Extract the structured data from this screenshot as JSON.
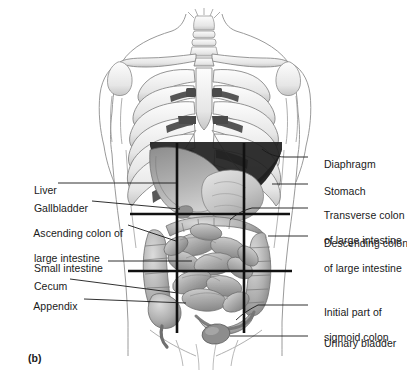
{
  "figure": {
    "caption": "(b)",
    "width": 407,
    "height": 387
  },
  "colors": {
    "line": "#1a1a1a",
    "outline": "#8a8a8a",
    "bone_light": "#f2f2f2",
    "bone_shade": "#c9c9c9",
    "organ_mid": "#a8a8a8",
    "organ_light": "#cfcfcf",
    "organ_dark": "#6e6e6e",
    "diaphragm_dark": "#2b2b2b",
    "background": "#ffffff"
  },
  "labels_left": [
    {
      "id": "liver",
      "text": "Liver",
      "x": 22,
      "y": 178,
      "lead_x1": 58,
      "lead_y1": 183,
      "lead_x2": 176,
      "lead_y2": 183
    },
    {
      "id": "gallbladder",
      "text": "Gallbladder",
      "x": 22,
      "y": 196,
      "lead_x1": 92,
      "lead_y1": 201,
      "lead_x2": 180,
      "lead_y2": 208
    },
    {
      "id": "ascending-colon",
      "text": "Ascending colon of",
      "text2": "large intestine",
      "x": 22,
      "y": 221,
      "lead_x1": 128,
      "lead_y1": 225,
      "lead_x2": 178,
      "lead_y2": 240
    },
    {
      "id": "small-intestine",
      "text": "Small intestine",
      "x": 22,
      "y": 256,
      "lead_x1": 108,
      "lead_y1": 261,
      "lead_x2": 190,
      "lead_y2": 261
    },
    {
      "id": "cecum",
      "text": "Cecum",
      "x": 22,
      "y": 274,
      "lead_x1": 70,
      "lead_y1": 279,
      "lead_x2": 180,
      "lead_y2": 292
    },
    {
      "id": "appendix",
      "text": "Appendix",
      "x": 22,
      "y": 294,
      "lead_x1": 84,
      "lead_y1": 299,
      "lead_x2": 186,
      "lead_y2": 303
    }
  ],
  "labels_right": [
    {
      "id": "diaphragm",
      "text": "Diaphragm",
      "x": 312,
      "y": 152,
      "lead_x1": 285,
      "lead_y1": 157,
      "lead_x2": 308,
      "lead_y2": 157
    },
    {
      "id": "stomach",
      "text": "Stomach",
      "x": 312,
      "y": 179,
      "lead_x1": 275,
      "lead_y1": 184,
      "lead_x2": 308,
      "lead_y2": 184
    },
    {
      "id": "transverse-colon",
      "text": "Transverse colon",
      "text2": "of large intestine",
      "x": 312,
      "y": 203,
      "lead_x1": 252,
      "lead_y1": 208,
      "lead_x2": 308,
      "lead_y2": 208
    },
    {
      "id": "descending-colon",
      "text": "Descending colon",
      "text2": "of large intestine",
      "x": 312,
      "y": 231,
      "lead_x1": 270,
      "lead_y1": 236,
      "lead_x2": 308,
      "lead_y2": 236
    },
    {
      "id": "sigmoid-colon",
      "text": "Initial part of",
      "text2": "sigmoid colon",
      "x": 312,
      "y": 300,
      "lead_x1": 258,
      "lead_y1": 305,
      "lead_x2": 308,
      "lead_y2": 305
    },
    {
      "id": "urinary-bladder",
      "text": "Urinary bladder",
      "x": 312,
      "y": 331,
      "lead_x1": 232,
      "lead_y1": 336,
      "lead_x2": 308,
      "lead_y2": 336
    }
  ],
  "grid_lines": {
    "description": "Four planes dividing the abdomen into nine regions",
    "vertical": [
      {
        "id": "left-midclavicular-line",
        "x": 177,
        "y1": 143,
        "y2": 333
      },
      {
        "id": "right-midclavicular-line",
        "x": 244,
        "y1": 143,
        "y2": 333
      }
    ],
    "horizontal": [
      {
        "id": "subcostal-plane",
        "y": 214,
        "x1": 130,
        "x2": 290
      },
      {
        "id": "intertubercular-plane",
        "y": 271,
        "x1": 128,
        "x2": 292
      }
    ]
  }
}
